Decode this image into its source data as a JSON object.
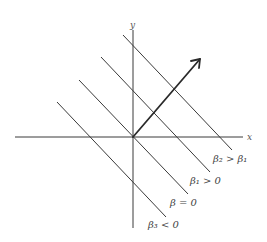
{
  "diagram": {
    "type": "level-set lines with gradient direction",
    "axes": {
      "x_label": "x",
      "y_label": "y"
    },
    "vector": {
      "description": "direction of increasing beta (normal to level lines)"
    },
    "level_lines": [
      {
        "label": "β₂ > β₁",
        "order": 1
      },
      {
        "label": "β₁ > 0",
        "order": 2
      },
      {
        "label": "β = 0",
        "order": 3
      },
      {
        "label": "β₃ < 0",
        "order": 4
      }
    ]
  }
}
